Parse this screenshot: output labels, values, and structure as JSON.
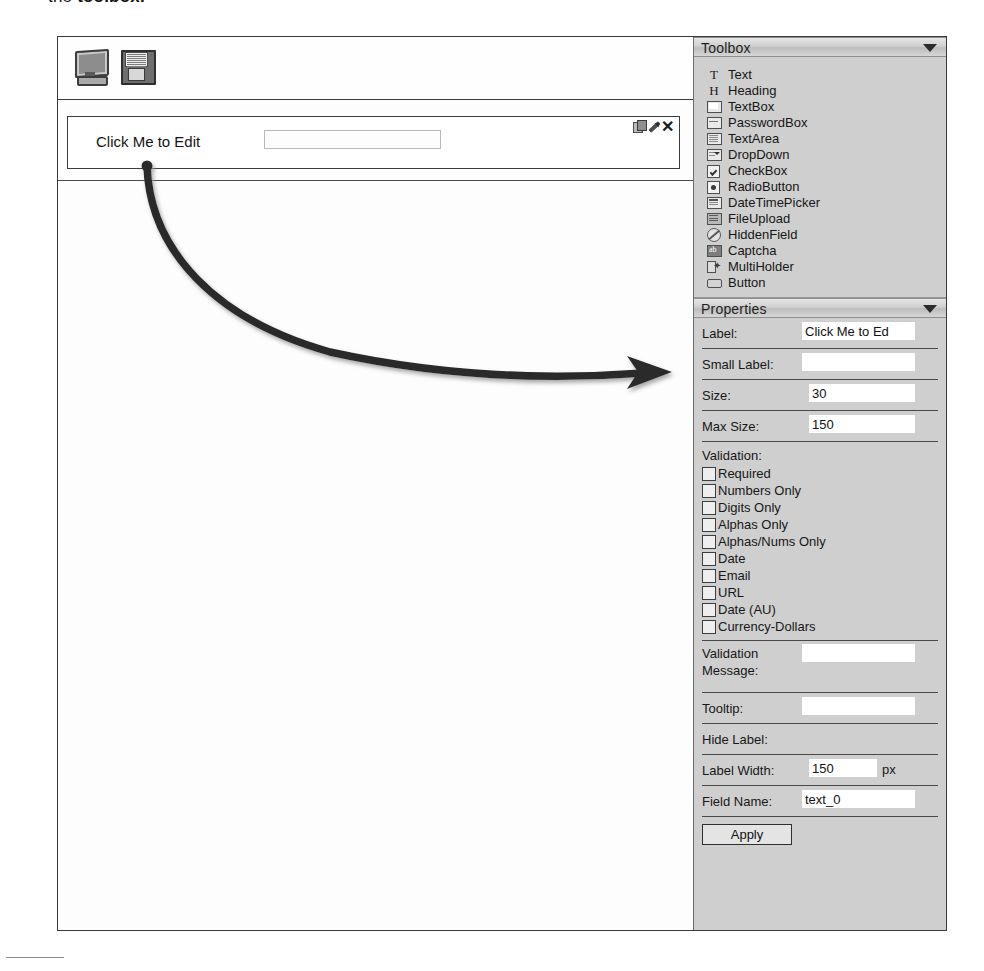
{
  "caption": {
    "text_before": "the ",
    "text_bold": "toolbox."
  },
  "editor": {
    "toolbar": {
      "preview_icon": "monitor-icon",
      "save_icon": "floppy-disk-icon"
    },
    "form_row": {
      "label": "Click Me to Edit",
      "input_value": "",
      "actions": {
        "copy": "copy-icon",
        "edit": "pencil-icon",
        "delete": "close-icon"
      }
    }
  },
  "toolbox": {
    "title": "Toolbox",
    "collapse_icon": "chevron-down-icon",
    "items": [
      {
        "label": "Text",
        "icon": "text-glyph-icon",
        "glyph": "T"
      },
      {
        "label": "Heading",
        "icon": "heading-glyph-icon",
        "glyph": "H"
      },
      {
        "label": "TextBox",
        "icon": "textbox-icon",
        "glyph": ""
      },
      {
        "label": "PasswordBox",
        "icon": "passwordbox-icon",
        "glyph": ""
      },
      {
        "label": "TextArea",
        "icon": "textarea-icon",
        "glyph": ""
      },
      {
        "label": "DropDown",
        "icon": "dropdown-icon",
        "glyph": ""
      },
      {
        "label": "CheckBox",
        "icon": "checkbox-icon",
        "glyph": ""
      },
      {
        "label": "RadioButton",
        "icon": "radiobutton-icon",
        "glyph": ""
      },
      {
        "label": "DateTimePicker",
        "icon": "datetimepicker-icon",
        "glyph": ""
      },
      {
        "label": "FileUpload",
        "icon": "fileupload-icon",
        "glyph": ""
      },
      {
        "label": "HiddenField",
        "icon": "hiddenfield-icon",
        "glyph": ""
      },
      {
        "label": "Captcha",
        "icon": "captcha-icon",
        "glyph": ""
      },
      {
        "label": "MultiHolder",
        "icon": "multiholder-icon",
        "glyph": ""
      },
      {
        "label": "Button",
        "icon": "button-icon",
        "glyph": ""
      }
    ]
  },
  "properties": {
    "title": "Properties",
    "collapse_icon": "chevron-down-icon",
    "fields": {
      "label": {
        "key": "Label:",
        "value": "Click Me to Ed"
      },
      "small_label": {
        "key": "Small Label:",
        "value": ""
      },
      "size": {
        "key": "Size:",
        "value": "30"
      },
      "max_size": {
        "key": "Max Size:",
        "value": "150"
      },
      "validation_message": {
        "key_line1": "Validation",
        "key_line2": "Message:",
        "value": ""
      },
      "tooltip": {
        "key": "Tooltip:",
        "value": ""
      },
      "hide_label": {
        "key": "Hide Label:",
        "checked": false
      },
      "label_width": {
        "key": "Label Width:",
        "value": "150",
        "unit": "px"
      },
      "field_name": {
        "key": "Field Name:",
        "value": "text_0"
      }
    },
    "validation": {
      "heading": "Validation:",
      "options": [
        {
          "label": "Required",
          "checked": false
        },
        {
          "label": "Numbers Only",
          "checked": false
        },
        {
          "label": "Digits Only",
          "checked": false
        },
        {
          "label": "Alphas Only",
          "checked": false
        },
        {
          "label": "Alphas/Nums Only",
          "checked": false
        },
        {
          "label": "Date",
          "checked": false
        },
        {
          "label": "Email",
          "checked": false
        },
        {
          "label": "URL",
          "checked": false
        },
        {
          "label": "Date (AU)",
          "checked": false
        },
        {
          "label": "Currency-Dollars",
          "checked": false
        }
      ]
    },
    "apply_button": "Apply"
  },
  "annotation": {
    "arrow": "curved-arrow-annotation",
    "from": "Click Me to Edit label",
    "to": "Label: property field"
  },
  "colors": {
    "panel_bg": "#cfcfcf",
    "panel_header_top": "#e6e6e6",
    "panel_header_bottom": "#bdbdbd",
    "canvas_bg": "#fdfdfd",
    "frame_border": "#3a3a3a",
    "input_bg": "#ffffff",
    "arrow": "#2a2a2a"
  }
}
